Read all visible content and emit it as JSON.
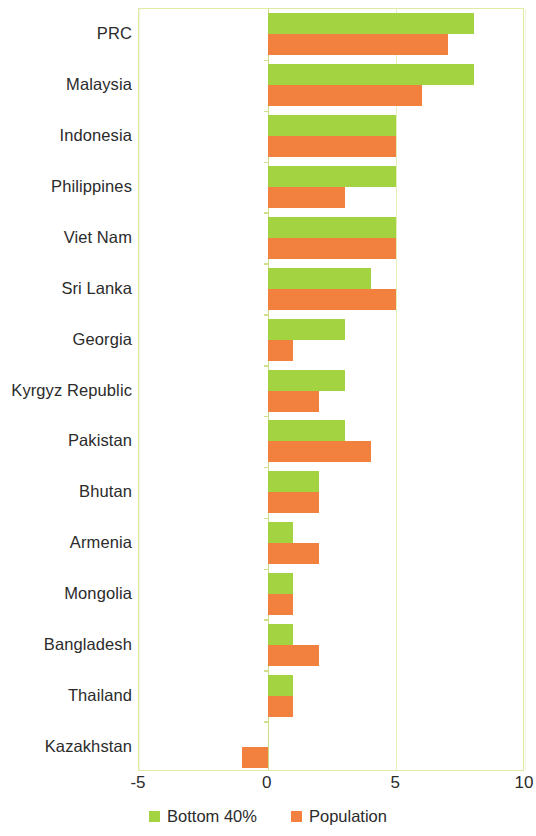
{
  "chart_data": {
    "type": "bar",
    "orientation": "horizontal",
    "title": "",
    "subtitle": "",
    "xlabel": "",
    "ylabel": "",
    "xlim": [
      -5,
      10
    ],
    "xticks": [
      -5,
      0,
      5,
      10
    ],
    "xtick_labels": [
      "-5",
      "0",
      "5",
      "10"
    ],
    "grid": "vertical",
    "legend_position": "bottom-center",
    "categories": [
      "PRC",
      "Malaysia",
      "Indonesia",
      "Philippines",
      "Viet Nam",
      "Sri Lanka",
      "Georgia",
      "Kyrgyz Republic",
      "Pakistan",
      "Bhutan",
      "Armenia",
      "Mongolia",
      "Bangladesh",
      "Thailand",
      "Kazakhstan"
    ],
    "series": [
      {
        "name": "Bottom 40%",
        "color": "#a3d340",
        "values": [
          8.0,
          8.0,
          5.0,
          5.0,
          5.0,
          4.0,
          3.0,
          3.0,
          3.0,
          2.0,
          1.0,
          1.0,
          1.0,
          1.0,
          0.0
        ]
      },
      {
        "name": "Population",
        "color": "#f2813f",
        "values": [
          7.0,
          6.0,
          5.0,
          3.0,
          5.0,
          5.0,
          1.0,
          2.0,
          4.0,
          2.0,
          2.0,
          1.0,
          2.0,
          1.0,
          -1.0
        ]
      }
    ]
  },
  "legend": {
    "entries": [
      {
        "label": "Bottom 40%",
        "color": "#a3d340"
      },
      {
        "label": "Population",
        "color": "#f2813f"
      }
    ]
  },
  "colors": {
    "bottom40": "#a3d340",
    "population": "#f2813f",
    "plot_border": "#dfeaa3",
    "gridline": "#e6efb9",
    "background": "#ffffff",
    "text": "#2b2b2b"
  }
}
